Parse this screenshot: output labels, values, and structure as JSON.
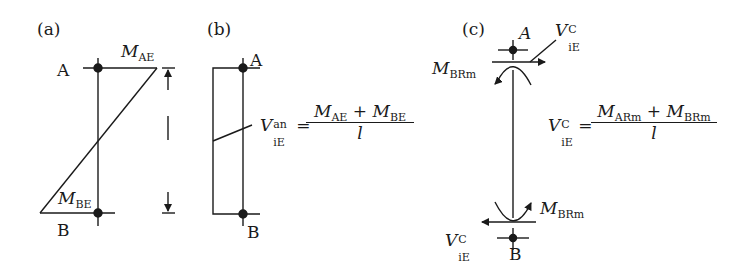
{
  "panels": {
    "a": {
      "label": "(a)",
      "node_top": "A",
      "node_bottom": "B",
      "moment_top": {
        "symbol": "M",
        "sub": "AE"
      },
      "moment_bottom": {
        "symbol": "M",
        "sub": "BE"
      }
    },
    "b": {
      "label": "(b)",
      "node_top": "A",
      "node_bottom": "B",
      "formula": {
        "lhs_symbol": "V",
        "lhs_sup": "an",
        "lhs_sub": "iE",
        "eq": "=",
        "num_m1": "M",
        "num_m1_sub": "AE",
        "plus": "+",
        "num_m2": "M",
        "num_m2_sub": "BE",
        "den": "l"
      }
    },
    "c": {
      "label": "(c)",
      "node_top": "A",
      "node_bottom": "B",
      "shear_top": {
        "symbol": "V",
        "sup": "C",
        "sub": "iE"
      },
      "shear_bottom": {
        "symbol": "V",
        "sup": "C",
        "sub": "iE"
      },
      "moment_top": {
        "symbol": "M",
        "sub": "BRm"
      },
      "moment_bottom": {
        "symbol": "M",
        "sub": "BRm"
      },
      "formula": {
        "lhs_symbol": "V",
        "lhs_sup": "C",
        "lhs_sub": "iE",
        "eq": "=",
        "num_m1": "M",
        "num_m1_sub": "ARm",
        "plus": "+",
        "num_m2": "M",
        "num_m2_sub": "BRm",
        "den": "l"
      }
    }
  }
}
